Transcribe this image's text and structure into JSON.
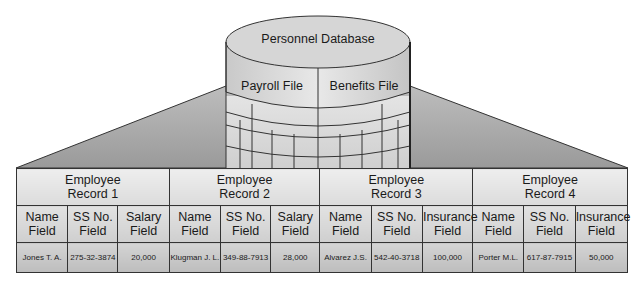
{
  "database": {
    "title": "Personnel Database",
    "files": [
      "Payroll File",
      "Benefits File"
    ]
  },
  "records": [
    {
      "title_line1": "Employee",
      "title_line2": "Record 1",
      "fields": [
        {
          "name_line1": "Name",
          "name_line2": "Field",
          "value": "Jones T. A."
        },
        {
          "name_line1": "SS No.",
          "name_line2": "Field",
          "value": "275-32-3874"
        },
        {
          "name_line1": "Salary",
          "name_line2": "Field",
          "value": "20,000"
        }
      ]
    },
    {
      "title_line1": "Employee",
      "title_line2": "Record 2",
      "fields": [
        {
          "name_line1": "Name",
          "name_line2": "Field",
          "value": "Klugman J. L."
        },
        {
          "name_line1": "SS No.",
          "name_line2": "Field",
          "value": "349-88-7913"
        },
        {
          "name_line1": "Salary",
          "name_line2": "Field",
          "value": "28,000"
        }
      ]
    },
    {
      "title_line1": "Employee",
      "title_line2": "Record 3",
      "fields": [
        {
          "name_line1": "Name",
          "name_line2": "Field",
          "value": "Alvarez J.S."
        },
        {
          "name_line1": "SS No.",
          "name_line2": "Field",
          "value": "542-40-3718"
        },
        {
          "name_line1": "Insurance",
          "name_line2": "Field",
          "value": "100,000"
        }
      ]
    },
    {
      "title_line1": "Employee",
      "title_line2": "Record 4",
      "fields": [
        {
          "name_line1": "Name",
          "name_line2": "Field",
          "value": "Porter M.L."
        },
        {
          "name_line1": "SS No.",
          "name_line2": "Field",
          "value": "617-87-7915"
        },
        {
          "name_line1": "Insurance",
          "name_line2": "Field",
          "value": "50,000"
        }
      ]
    }
  ]
}
